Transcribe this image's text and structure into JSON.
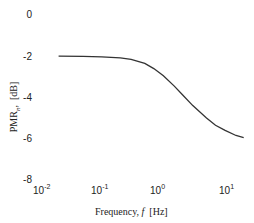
{
  "chart_data": {
    "type": "line",
    "title": "",
    "xlabel": "Frequency, f [Hz]",
    "ylabel": "PMR_n, [dB]",
    "xscale": "log",
    "xlim": [
      0.01,
      20
    ],
    "ylim": [
      -8,
      0
    ],
    "grid": false,
    "legend": null,
    "xticks": [
      "10^-2",
      "10^-1",
      "10^0",
      "10^1"
    ],
    "yticks": [
      "0",
      "-2",
      "-4",
      "-6",
      "-8"
    ],
    "series": [
      {
        "name": "PMR_n",
        "color": "#333333",
        "x": [
          0.02,
          0.05,
          0.1,
          0.2,
          0.3,
          0.5,
          0.7,
          1.0,
          1.5,
          2.0,
          3.0,
          5.0,
          7.0,
          10.0,
          15.0,
          20.0
        ],
        "y": [
          -2.0,
          -2.01,
          -2.03,
          -2.08,
          -2.15,
          -2.35,
          -2.6,
          -2.95,
          -3.45,
          -3.85,
          -4.4,
          -5.0,
          -5.35,
          -5.6,
          -5.85,
          -5.95
        ]
      }
    ]
  },
  "axes": {
    "y_ticks": [
      {
        "label": "0",
        "top": 9
      },
      {
        "label": "-2",
        "top": 51
      },
      {
        "label": "-4",
        "top": 92
      },
      {
        "label": "-6",
        "top": 133
      },
      {
        "label": "-8",
        "top": 174
      }
    ],
    "x_ticks": [
      {
        "base": "10",
        "exp": "-2"
      },
      {
        "base": "10",
        "exp": "-1"
      },
      {
        "base": "10",
        "exp": "0"
      },
      {
        "base": "10",
        "exp": "1"
      }
    ],
    "xlabel_text": "Frequency, ",
    "xlabel_var": "f",
    "xlabel_unit": "[Hz]",
    "ylabel_text": "PMR",
    "ylabel_sub": "n",
    "ylabel_unit": "[dB]"
  }
}
